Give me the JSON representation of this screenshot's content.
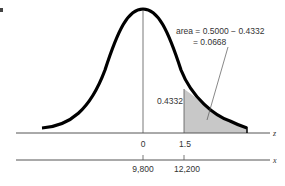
{
  "figure": {
    "corner_mark": "",
    "annotation": {
      "line1": "area = 0.5000 − 0.4332",
      "line2": "= 0.0668"
    },
    "center_area_label": "0.4332",
    "z_axis": {
      "label": "z",
      "ticks": [
        "0",
        "1.5"
      ]
    },
    "x_axis": {
      "label": "x",
      "ticks": [
        "9,800",
        "12,200"
      ]
    },
    "colors": {
      "curve": "#000000",
      "shade": "#c8c8c8",
      "axis": "#555555"
    }
  }
}
